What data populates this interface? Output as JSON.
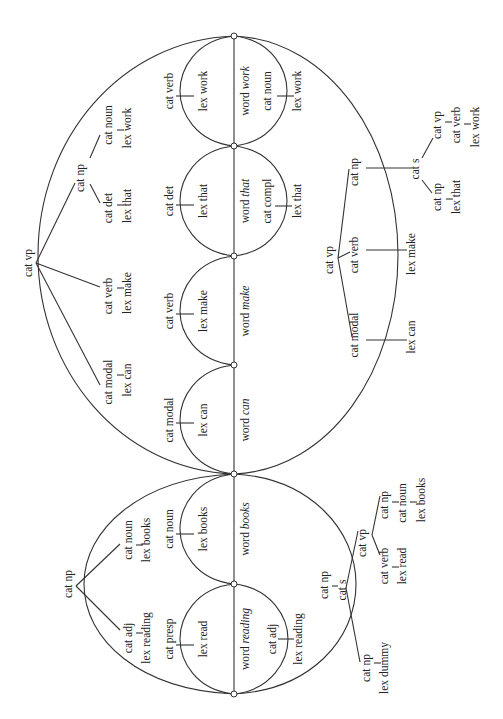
{
  "diagram": {
    "colors": {
      "line": "#333333",
      "text": "#222222",
      "background": "#ffffff"
    },
    "nodes_y": [
      36,
      146,
      256,
      365,
      474,
      584,
      694
    ],
    "words": [
      {
        "label": "word",
        "word": "work"
      },
      {
        "label": "word",
        "word": "that"
      },
      {
        "label": "word",
        "word": "make"
      },
      {
        "label": "word",
        "word": "can"
      },
      {
        "label": "word",
        "word": "books"
      },
      {
        "label": "word",
        "word": "reading"
      }
    ],
    "left_lex_edges": [
      {
        "cat": "cat  verb",
        "lex": "lex  work"
      },
      {
        "cat": "cat  det",
        "lex": "lex  that"
      },
      {
        "cat": "cat  verb",
        "lex": "lex  make"
      },
      {
        "cat": "cat  modal",
        "lex": "lex  can"
      },
      {
        "cat": "cat  noun",
        "lex": "lex  books"
      },
      {
        "cat": "cat  presp",
        "lex": "lex  read"
      }
    ],
    "right_lex_edges": [
      {
        "cat": "cat  noun",
        "lex": "lex  work"
      },
      {
        "cat": "cat compl",
        "lex": "lex  that"
      },
      {
        "cat": "cat  adj",
        "lex": "lex  reading"
      }
    ],
    "vp_tree_upper_left": {
      "root": "cat  vp",
      "children": [
        {
          "cat": "cat  np",
          "children": [
            {
              "cat": "cat  det",
              "lex": "lex  that"
            },
            {
              "cat": "cat  noun",
              "lex": "lex work"
            }
          ]
        },
        {
          "cat": "cat  verb",
          "lex": "lex  make"
        },
        {
          "cat": "cat  modal",
          "lex": "lex  can"
        }
      ]
    },
    "np_tree_lower_left": {
      "root": "cat  np",
      "children": [
        {
          "cat": "cat  noun",
          "lex": "lex  books"
        },
        {
          "cat": "cat  adj",
          "lex": "lex  reading"
        }
      ]
    },
    "vp_tree_upper_right": {
      "root": "cat  vp",
      "children": [
        {
          "cat": "cat  np",
          "connector": "cat  s",
          "s_children": [
            {
              "cat": "cat  vp",
              "sub": "cat  verb",
              "lex": "lex  work"
            },
            {
              "cat": "cat  np",
              "lex": "lex  that"
            }
          ]
        },
        {
          "cat": "cat  verb",
          "lex": "lex  make"
        },
        {
          "cat": "cat  modal",
          "lex": "lex  can"
        }
      ]
    },
    "s_tree_lower_right": {
      "np_label": "cat  np",
      "s_label": "cat  s",
      "vp": {
        "cat": "cat  vp",
        "children": [
          {
            "cat": "cat  np",
            "sub": "cat  noun",
            "lex": "lex  books"
          },
          {
            "cat": "cat  verb",
            "lex": "lex  read"
          }
        ]
      },
      "np_dummy": {
        "cat": "cat  np",
        "lex": "lex dummy"
      }
    }
  }
}
